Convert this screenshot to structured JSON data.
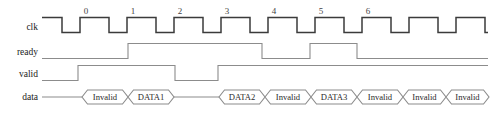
{
  "diagram": {
    "colors": {
      "background": "#ffffff",
      "clock_stroke": "#3b3b3b",
      "signal_stroke": "#8c8c8c",
      "text": "#1a1a1a",
      "cycle_number": "#444444"
    },
    "geometry": {
      "wave_start_x": 42,
      "wave_end_x": 488,
      "half_period": 23.5,
      "label_x": 38,
      "row_clk_y": 27,
      "row_ready_y": 52,
      "row_valid_y": 74,
      "row_data_y": 97
    },
    "cycle_numbers": [
      {
        "label": "0",
        "x": 86
      },
      {
        "label": "1",
        "x": 133
      },
      {
        "label": "2",
        "x": 180
      },
      {
        "label": "3",
        "x": 227
      },
      {
        "label": "4",
        "x": 274
      },
      {
        "label": "5",
        "x": 321
      },
      {
        "label": "6",
        "x": 368
      }
    ],
    "signals": [
      {
        "name": "clk",
        "label": "clk",
        "type": "clock",
        "row_y": 27,
        "amplitude": 11,
        "start_level": "high",
        "edges_x": [
          62,
          80,
          109,
          127,
          156,
          174,
          203,
          221,
          250,
          268,
          297,
          315,
          344,
          362,
          391,
          409,
          438,
          456,
          485
        ]
      },
      {
        "name": "ready",
        "label": "ready",
        "type": "level",
        "row_y": 52,
        "amplitude": 11,
        "start_level": "low",
        "transitions": [
          {
            "x": 128,
            "to": "high"
          },
          {
            "x": 262,
            "to": "low"
          },
          {
            "x": 310,
            "to": "high"
          },
          {
            "x": 357,
            "to": "low"
          }
        ]
      },
      {
        "name": "valid",
        "label": "valid",
        "type": "level",
        "row_y": 74,
        "amplitude": 11,
        "start_level": "low",
        "transitions": [
          {
            "x": 78,
            "to": "high"
          },
          {
            "x": 175,
            "to": "low"
          },
          {
            "x": 218,
            "to": "high"
          }
        ]
      },
      {
        "name": "data",
        "label": "data",
        "type": "bus",
        "row_y": 97,
        "amplitude": 7,
        "segments": [
          {
            "kind": "idle",
            "x1": 42,
            "x2": 82
          },
          {
            "kind": "value",
            "x1": 82,
            "x2": 128,
            "value": "Invalid"
          },
          {
            "kind": "value",
            "x1": 128,
            "x2": 174,
            "value": "DATA1"
          },
          {
            "kind": "idle",
            "x1": 174,
            "x2": 219
          },
          {
            "kind": "value",
            "x1": 219,
            "x2": 265,
            "value": "DATA2"
          },
          {
            "kind": "value",
            "x1": 265,
            "x2": 311,
            "value": "Invalid"
          },
          {
            "kind": "value",
            "x1": 311,
            "x2": 357,
            "value": "DATA3"
          },
          {
            "kind": "value",
            "x1": 357,
            "x2": 403,
            "value": "Invalid"
          },
          {
            "kind": "value",
            "x1": 403,
            "x2": 446,
            "value": "Invalid"
          },
          {
            "kind": "value",
            "x1": 446,
            "x2": 489,
            "value": "Invalid"
          }
        ]
      }
    ]
  }
}
